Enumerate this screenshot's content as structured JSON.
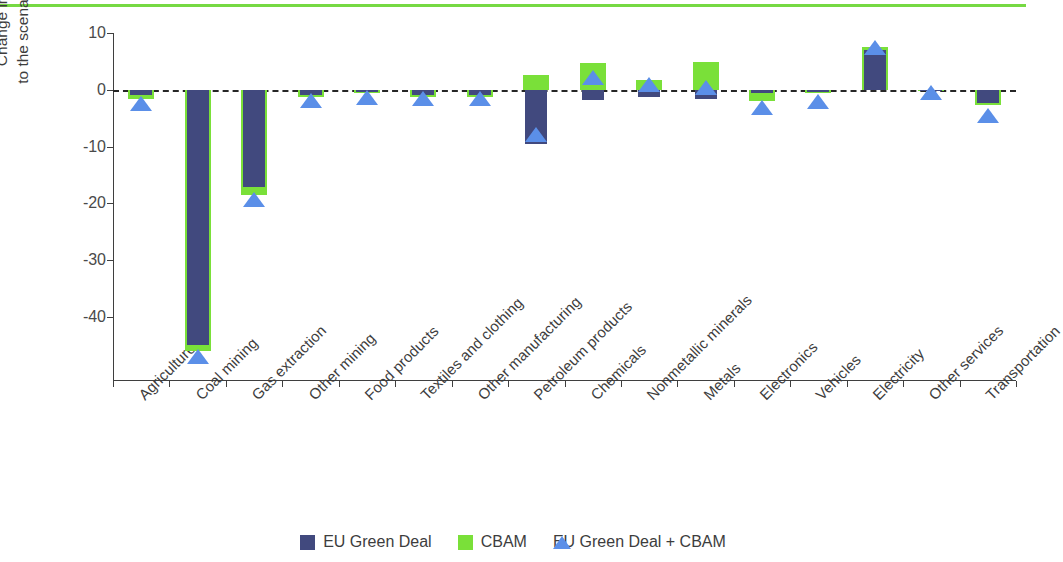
{
  "figure": {
    "accent_rule_color": "#76d943",
    "background": "#ffffff"
  },
  "chart_data": {
    "type": "bar",
    "title": "",
    "xlabel": "",
    "ylabel": "Change in output relative to the scenario with NDCs (%)",
    "ylabel_line1": "Change in output relative",
    "ylabel_line2": "to the scenario with NDCs (%)",
    "ylim": [
      -47,
      10
    ],
    "yticks": [
      10,
      0,
      -10,
      -20,
      -30,
      -40
    ],
    "ytick_labels": [
      "10",
      "0",
      "-10",
      "-20",
      "-30",
      "-40"
    ],
    "grid": false,
    "zero_reference_line": true,
    "legend_position": "bottom",
    "categories": [
      "Agriculture",
      "Coal mining",
      "Gas extraction",
      "Other mining",
      "Food products",
      "Textiles and clothing",
      "Other manufacturing",
      "Petroleum products",
      "Chemicals",
      "Nonmetallic minerals",
      "Metals",
      "Electronics",
      "Vehicles",
      "Electricity",
      "Other services",
      "Transportation"
    ],
    "series": [
      {
        "name": "EU Green Deal",
        "type": "bar",
        "color": "#41497e",
        "values": [
          -1.0,
          -44.9,
          -17.1,
          -1.0,
          -0.3,
          -1.0,
          -1.0,
          -9.5,
          -1.8,
          -1.3,
          -1.6,
          -0.6,
          -0.3,
          7.0,
          0.0,
          -2.3
        ]
      },
      {
        "name": "CBAM",
        "type": "bar",
        "color": "#7ae039",
        "values": [
          -1.6,
          -45.9,
          -18.5,
          -1.2,
          -0.6,
          -1.2,
          -1.2,
          2.6,
          4.8,
          1.7,
          4.9,
          -2.0,
          -0.5,
          7.6,
          0.0,
          -2.6
        ]
      },
      {
        "name": "EU Green Deal + CBAM",
        "type": "marker-triangle",
        "color": "#5b8fe8",
        "values": [
          -2.4,
          -46.8,
          -19.2,
          -1.8,
          -1.2,
          -1.5,
          -1.5,
          -7.7,
          2.2,
          1.1,
          0.5,
          -3.0,
          -2.0,
          7.5,
          -0.3,
          -4.5
        ]
      }
    ]
  },
  "legend": {
    "items": [
      {
        "label": "EU Green Deal",
        "marker": "square",
        "color": "#41497e"
      },
      {
        "label": "CBAM",
        "marker": "square",
        "color": "#7ae039"
      },
      {
        "label": "EU Green Deal + CBAM",
        "marker": "triangle",
        "color": "#5b8fe8"
      }
    ]
  }
}
